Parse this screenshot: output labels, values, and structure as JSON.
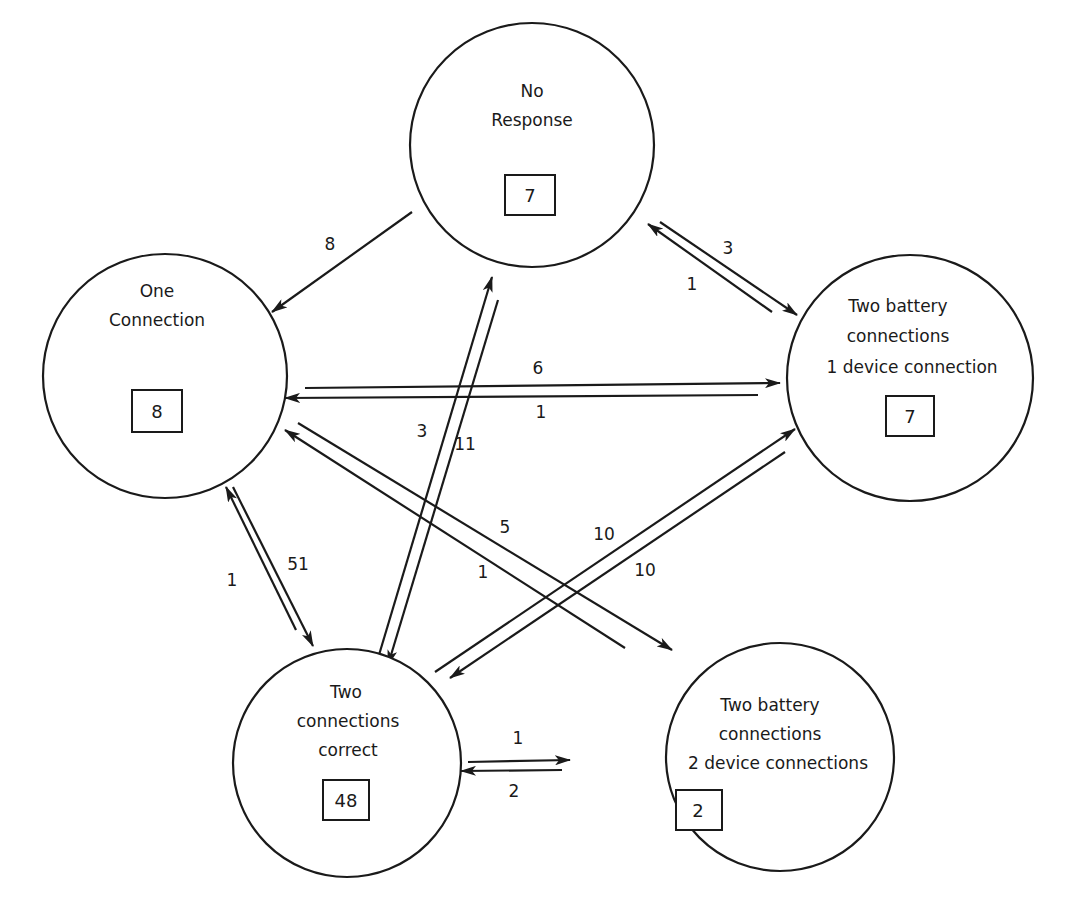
{
  "diagram": {
    "type": "state-transition",
    "nodes": [
      {
        "id": "no_response",
        "lines": [
          "No",
          "Response"
        ],
        "count": "7",
        "cx": 532,
        "cy": 145,
        "r": 122
      },
      {
        "id": "one_connection",
        "lines": [
          "One",
          "Connection"
        ],
        "count": "8",
        "cx": 165,
        "cy": 376,
        "r": 122
      },
      {
        "id": "two_battery_1_device",
        "lines": [
          "Two battery",
          "connections",
          "1 device connection"
        ],
        "count": "7",
        "cx": 907,
        "cy": 377,
        "r": 122
      },
      {
        "id": "two_connections_correct",
        "lines": [
          "Two",
          "connections",
          "correct"
        ],
        "count": "48",
        "cx": 347,
        "cy": 763,
        "r": 114
      },
      {
        "id": "two_battery_2_device",
        "lines": [
          "Two battery",
          "connections",
          "2 device connections"
        ],
        "count": "2",
        "cx": 777,
        "cy": 757,
        "r": 114
      }
    ],
    "edges": [
      {
        "from": "no_response",
        "to": "one_connection",
        "label": "8"
      },
      {
        "from": "no_response",
        "to": "two_battery_1_device",
        "label": "3"
      },
      {
        "from": "two_battery_1_device",
        "to": "no_response",
        "label": "1"
      },
      {
        "from": "one_connection",
        "to": "two_battery_1_device",
        "label": "6"
      },
      {
        "from": "two_battery_1_device",
        "to": "one_connection",
        "label": "1"
      },
      {
        "from": "two_connections_correct",
        "to": "no_response",
        "label": "3"
      },
      {
        "from": "no_response",
        "to": "two_connections_correct",
        "label": "11"
      },
      {
        "from": "two_connections_correct",
        "to": "one_connection",
        "label": "1"
      },
      {
        "from": "one_connection",
        "to": "two_connections_correct",
        "label": "51"
      },
      {
        "from": "two_battery_2_device",
        "to": "one_connection",
        "label": "1"
      },
      {
        "from": "one_connection",
        "to": "two_battery_2_device",
        "label": "5"
      },
      {
        "from": "two_connections_correct",
        "to": "two_battery_1_device",
        "label": "10"
      },
      {
        "from": "two_battery_1_device",
        "to": "two_connections_correct",
        "label": "10"
      },
      {
        "from": "two_connections_correct",
        "to": "two_battery_2_device",
        "label": "1"
      },
      {
        "from": "two_battery_2_device",
        "to": "two_connections_correct",
        "label": "2"
      }
    ]
  }
}
